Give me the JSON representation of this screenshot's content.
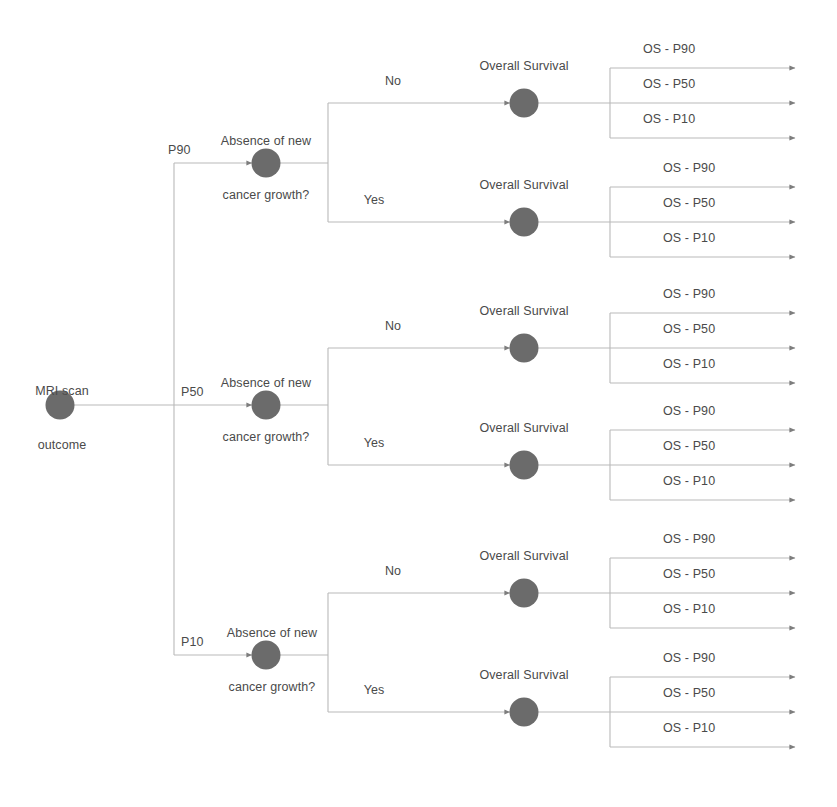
{
  "diagram": {
    "colors": {
      "node_fill": "#6b6b6b",
      "edge": "#b9b9b9",
      "text": "#4a4a4a",
      "background": "#ffffff",
      "arrowhead": "#7d7d7d"
    },
    "root": {
      "label_line1": "MRI scan",
      "label_line2": "outcome"
    },
    "branch_labels": [
      "P90",
      "P50",
      "P10"
    ],
    "decision": {
      "label_line1": "Absence of new",
      "label_line2": "cancer growth?"
    },
    "decision_answers": [
      "No",
      "Yes"
    ],
    "outcome_node_label": "Overall Survival",
    "outcome_arrow_labels": [
      "OS - P90",
      "OS - P50",
      "OS - P10"
    ],
    "branches": [
      {
        "probability": "P90",
        "decision_label_line1": "Absence of new",
        "decision_label_line2": "cancer growth?",
        "answers": [
          {
            "answer": "No",
            "outcome": "Overall Survival",
            "arrows": [
              "OS - P90",
              "OS - P50",
              "OS - P10"
            ]
          },
          {
            "answer": "Yes",
            "outcome": "Overall Survival",
            "arrows": [
              "OS - P90",
              "OS - P50",
              "OS - P10"
            ]
          }
        ]
      },
      {
        "probability": "P50",
        "decision_label_line1": "Absence of new",
        "decision_label_line2": "cancer growth?",
        "answers": [
          {
            "answer": "No",
            "outcome": "Overall Survival",
            "arrows": [
              "OS - P90",
              "OS - P50",
              "OS - P10"
            ]
          },
          {
            "answer": "Yes",
            "outcome": "Overall Survival",
            "arrows": [
              "OS - P90",
              "OS - P50",
              "OS - P10"
            ]
          }
        ]
      },
      {
        "probability": "P10",
        "decision_label_line1": "Absence of new",
        "decision_label_line2": "cancer growth?",
        "answers": [
          {
            "answer": "No",
            "outcome": "Overall Survival",
            "arrows": [
              "OS - P90",
              "OS - P50",
              "OS - P10"
            ]
          },
          {
            "answer": "Yes",
            "outcome": "Overall Survival",
            "arrows": [
              "OS - P90",
              "OS - P50",
              "OS - P10"
            ]
          }
        ]
      }
    ]
  }
}
